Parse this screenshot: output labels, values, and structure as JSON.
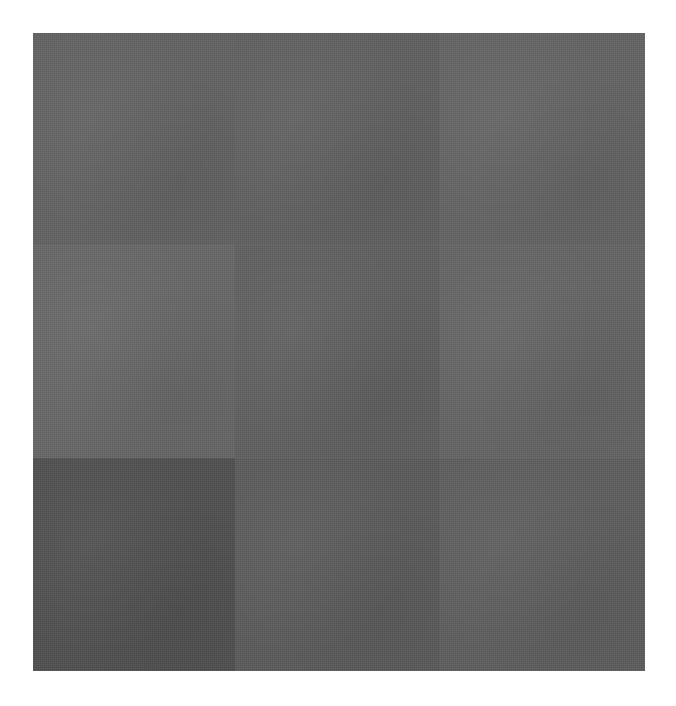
{
  "image": {
    "description": "Gray textured square on white background",
    "background_color": "#ffffff",
    "tiles": [
      {
        "row": 0,
        "col": 0,
        "color": "#626262"
      },
      {
        "row": 0,
        "col": 1,
        "color": "#606060"
      },
      {
        "row": 0,
        "col": 2,
        "color": "#636363"
      },
      {
        "row": 1,
        "col": 0,
        "color": "#666666"
      },
      {
        "row": 1,
        "col": 1,
        "color": "#5f5f5f"
      },
      {
        "row": 1,
        "col": 2,
        "color": "#646464"
      },
      {
        "row": 2,
        "col": 0,
        "color": "#4f4f4f"
      },
      {
        "row": 2,
        "col": 1,
        "color": "#5a5a5a"
      },
      {
        "row": 2,
        "col": 2,
        "color": "#5d5d5d"
      }
    ]
  }
}
